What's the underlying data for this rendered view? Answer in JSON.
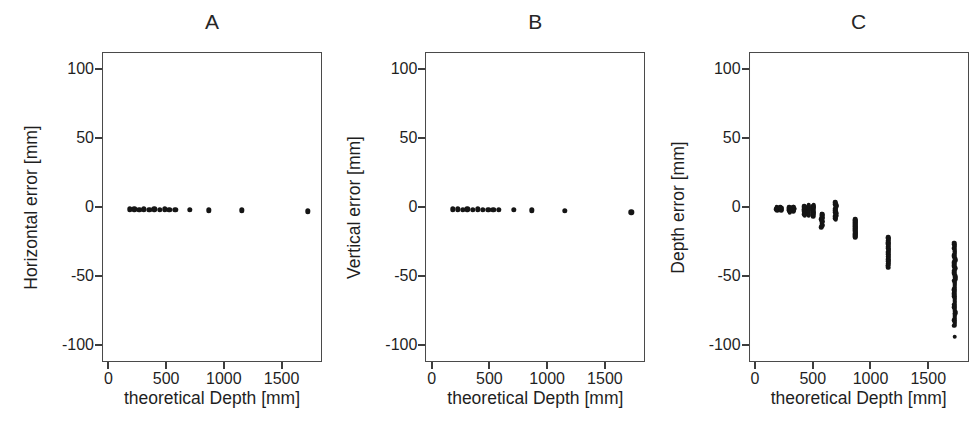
{
  "figure": {
    "background_color": "#ffffff",
    "marker_color": "#151515",
    "axis_color": "#4a4a4a"
  },
  "panels": [
    {
      "title": "A",
      "ylabel": "Horizontal error [mm]",
      "xlabel": "theoretical Depth [mm]"
    },
    {
      "title": "B",
      "ylabel": "Vertical error [mm]",
      "xlabel": "theoretical Depth [mm]"
    },
    {
      "title": "C",
      "ylabel": "Depth error [mm]",
      "xlabel": "theoretical Depth [mm]"
    }
  ],
  "axes": {
    "xticks": [
      0,
      500,
      1000,
      1500
    ],
    "xtick_labels": [
      "0",
      "500",
      "1000",
      "1500"
    ],
    "yticks": [
      100,
      50,
      0,
      -50,
      -100
    ],
    "ytick_labels": [
      "100",
      "50",
      "0",
      "-50",
      "-100"
    ],
    "xlim": [
      -55,
      1850
    ],
    "ylim": [
      -112,
      112
    ]
  },
  "chart_data": [
    {
      "type": "scatter",
      "title": "A",
      "xlabel": "theoretical Depth [mm]",
      "ylabel": "Horizontal error [mm]",
      "xlim": [
        -55,
        1850
      ],
      "ylim": [
        -112,
        112
      ],
      "xticks": [
        0,
        500,
        1000,
        1500
      ],
      "yticks": [
        100,
        50,
        0,
        -50,
        -100
      ],
      "grid": false,
      "legend": false,
      "points": [
        {
          "x": 175,
          "y": -1.0
        },
        {
          "x": 215,
          "y": -1.0
        },
        {
          "x": 260,
          "y": -1.2
        },
        {
          "x": 300,
          "y": -1.0
        },
        {
          "x": 345,
          "y": -1.2
        },
        {
          "x": 390,
          "y": -1.0
        },
        {
          "x": 435,
          "y": -1.3
        },
        {
          "x": 480,
          "y": -1.0
        },
        {
          "x": 520,
          "y": -1.2
        },
        {
          "x": 570,
          "y": -1.4
        },
        {
          "x": 695,
          "y": -1.5
        },
        {
          "x": 860,
          "y": -1.6
        },
        {
          "x": 1145,
          "y": -1.6
        },
        {
          "x": 1720,
          "y": -2.5
        }
      ]
    },
    {
      "type": "scatter",
      "title": "B",
      "xlabel": "theoretical Depth [mm]",
      "ylabel": "Vertical error [mm]",
      "xlim": [
        -55,
        1850
      ],
      "ylim": [
        -112,
        112
      ],
      "xticks": [
        0,
        500,
        1000,
        1500
      ],
      "yticks": [
        100,
        50,
        0,
        -50,
        -100
      ],
      "grid": false,
      "legend": false,
      "points": [
        {
          "x": 175,
          "y": -1.0
        },
        {
          "x": 215,
          "y": -1.0
        },
        {
          "x": 260,
          "y": -1.1
        },
        {
          "x": 300,
          "y": -1.0
        },
        {
          "x": 345,
          "y": -1.2
        },
        {
          "x": 390,
          "y": -1.0
        },
        {
          "x": 435,
          "y": -1.2
        },
        {
          "x": 480,
          "y": -1.1
        },
        {
          "x": 525,
          "y": -1.3
        },
        {
          "x": 575,
          "y": -1.2
        },
        {
          "x": 700,
          "y": -1.5
        },
        {
          "x": 860,
          "y": -1.8
        },
        {
          "x": 1145,
          "y": -2.0
        },
        {
          "x": 1720,
          "y": -3.0
        }
      ]
    },
    {
      "type": "scatter",
      "title": "C",
      "xlabel": "theoretical Depth [mm]",
      "ylabel": "Depth error [mm]",
      "xlim": [
        -55,
        1850
      ],
      "ylim": [
        -112,
        112
      ],
      "xticks": [
        0,
        500,
        1000,
        1500
      ],
      "yticks": [
        100,
        50,
        0,
        -50,
        -100
      ],
      "grid": false,
      "legend": false,
      "note": "clusters of repeated measurements at each depth; spread and negative bias grow with depth",
      "clusters": [
        {
          "x": 178,
          "ymin": -1.5,
          "ymax": 0.5,
          "n": 6
        },
        {
          "x": 215,
          "ymin": -1.5,
          "ymax": 0.5,
          "n": 6
        },
        {
          "x": 290,
          "ymin": -3.0,
          "ymax": 0.5,
          "n": 8
        },
        {
          "x": 325,
          "ymin": -2.5,
          "ymax": 1.0,
          "n": 8
        },
        {
          "x": 420,
          "ymin": -5.0,
          "ymax": 1.5,
          "n": 12
        },
        {
          "x": 455,
          "ymin": -5.5,
          "ymax": 2.0,
          "n": 12
        },
        {
          "x": 495,
          "ymin": -6.0,
          "ymax": 2.0,
          "n": 14
        },
        {
          "x": 570,
          "ymin": -14.0,
          "ymax": -4.0,
          "n": 16
        },
        {
          "x": 690,
          "ymin": -8.0,
          "ymax": 4.0,
          "n": 20
        },
        {
          "x": 860,
          "ymin": -21.0,
          "ymax": -8.0,
          "n": 22
        },
        {
          "x": 1145,
          "ymin": -43.0,
          "ymax": -21.0,
          "n": 26
        },
        {
          "x": 1720,
          "ymin": -85.0,
          "ymax": -25.0,
          "n": 60
        }
      ],
      "outliers": [
        {
          "x": 1720,
          "y": -93.0
        }
      ]
    }
  ]
}
